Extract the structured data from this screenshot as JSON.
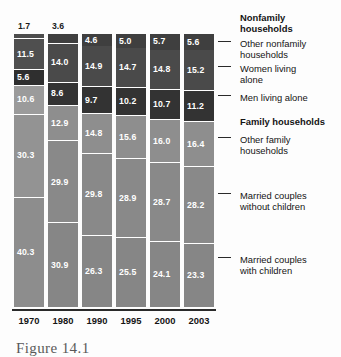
{
  "chart_data": {
    "type": "bar",
    "subtype": "stacked-bar-100-percent",
    "title": "",
    "xlabel": "",
    "ylabel": "",
    "ylim": [
      0,
      100
    ],
    "grid": false,
    "legend_position": "right",
    "categories": [
      "1970",
      "1980",
      "1990",
      "1995",
      "2000",
      "2003"
    ],
    "series": [
      {
        "name": "Married couples with children",
        "values": [
          40.3,
          30.9,
          26.3,
          25.5,
          24.1,
          23.3
        ],
        "color": "#868686"
      },
      {
        "name": "Married couples without children",
        "values": [
          30.3,
          29.9,
          29.8,
          28.9,
          28.7,
          28.2
        ],
        "color": "#898989"
      },
      {
        "name": "Other family households",
        "values": [
          10.6,
          12.9,
          14.8,
          15.6,
          16.0,
          16.4
        ],
        "color": "#8e8e8e"
      },
      {
        "name": "Men living alone",
        "values": [
          5.6,
          8.6,
          9.7,
          10.2,
          10.7,
          11.2
        ],
        "color": "#333333"
      },
      {
        "name": "Women living alone",
        "values": [
          11.5,
          14.0,
          14.9,
          14.7,
          14.8,
          15.2
        ],
        "color": "#4a4a4a"
      },
      {
        "name": "Other nonfamily households",
        "values": [
          1.7,
          3.6,
          4.6,
          5.0,
          5.7,
          5.6
        ],
        "color": "#3f3f3f"
      }
    ],
    "annotations": [
      {
        "text": "1.7",
        "note": "value label placed above the 1970 bar because the segment is too thin for an inside label"
      }
    ]
  },
  "legend": {
    "groups": [
      {
        "kind": "header",
        "label": "Nonfamily\nhouseholds",
        "line1": "Nonfamily",
        "line2": "households"
      },
      {
        "kind": "item",
        "label": "Other nonfamily households",
        "line1": "Other nonfamily",
        "line2": "households"
      },
      {
        "kind": "item",
        "label": "Women living alone",
        "line1": "Women living",
        "line2": "alone"
      },
      {
        "kind": "item",
        "label": "Men living alone",
        "line1": "Men living alone",
        "line2": ""
      },
      {
        "kind": "header",
        "label": "Family households",
        "line1": "Family households",
        "line2": ""
      },
      {
        "kind": "item",
        "label": "Other family households",
        "line1": "Other family",
        "line2": "households"
      },
      {
        "kind": "item",
        "label": "Married couples without children",
        "line1": "Married couples",
        "line2": "without children"
      },
      {
        "kind": "item",
        "label": "Married couples with children",
        "line1": "Married couples",
        "line2": "with children"
      }
    ]
  },
  "axis": {
    "years": [
      "1970",
      "1980",
      "1990",
      "1995",
      "2000",
      "2003"
    ]
  },
  "caption": {
    "text": "Figure 14.1"
  },
  "colors": {
    "other_nonfamily": "#3f3f3f",
    "women_alone": "#4a4a4a",
    "men_alone": "#333333",
    "other_family": "#8e8e8e",
    "married_no_children": "#898989",
    "married_with_children": "#868686",
    "separator": "#ffffff",
    "axis": "#2a2a2a",
    "value_label": "#ffffff",
    "text": "#141414"
  }
}
